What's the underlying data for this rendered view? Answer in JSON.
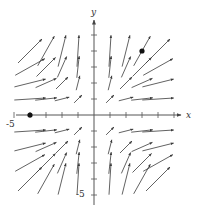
{
  "figure": {
    "type": "vector-field",
    "field_description": "F(x, y) = x^2 i + y^2 j (all arrows point up/right)",
    "x_axis_label": "x",
    "y_axis_label": "y",
    "x_tick_label": "-5",
    "y_tick_label": "-5",
    "origin_px": [
      94,
      115
    ],
    "unit_px": 16,
    "x_range": [
      -5,
      5
    ],
    "y_range": [
      -5,
      5
    ],
    "grid_points": [
      -4,
      -3,
      -2,
      -1,
      1,
      2,
      3,
      4
    ],
    "marked_points": [
      {
        "x": 3,
        "y": 4
      },
      {
        "x": -4,
        "y": 0
      }
    ],
    "colors": {
      "arrow": "#3a3a3a",
      "axis": "#555555",
      "point": "#111111"
    }
  }
}
